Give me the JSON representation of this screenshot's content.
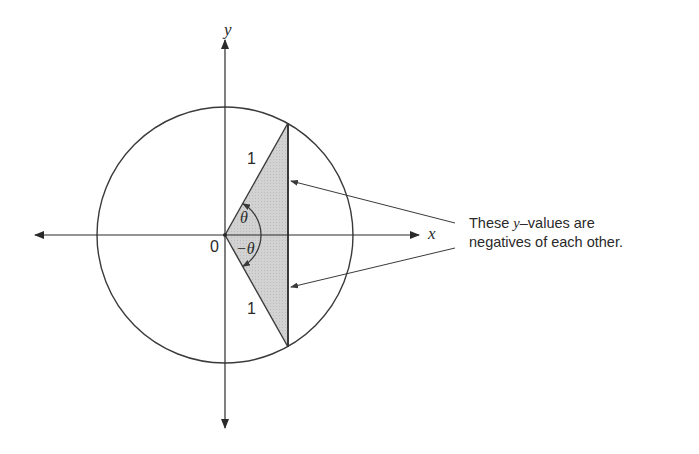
{
  "figure": {
    "axes": {
      "x_label": "x",
      "y_label": "y",
      "origin_label": "0"
    },
    "unit_circle": {
      "center": [
        225,
        235
      ],
      "radius_px": 128
    },
    "triangle": {
      "side_label_upper": "1",
      "side_label_lower": "1",
      "angle_upper": "θ",
      "angle_lower": "−θ",
      "fill_color": "#cfcfcf",
      "angle_degrees": 60
    },
    "annotation": {
      "line1_prefix": "These ",
      "line1_var": "y",
      "line1_suffix": "–values are",
      "line2": "negatives of each other."
    },
    "colors": {
      "stroke": "#3a3a3a",
      "text": "#2a2a2a",
      "background": "#ffffff"
    }
  }
}
